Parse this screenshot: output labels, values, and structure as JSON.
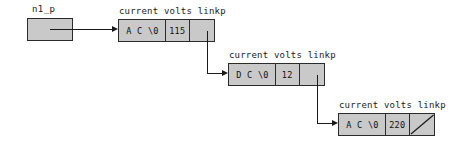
{
  "diagram": {
    "colors": {
      "box_fill": "#c9c9c9",
      "box_border": "#2b2b2b",
      "line": "#1a1a1a",
      "background": "#ffffff",
      "text": "#101010"
    },
    "pointer_variable": {
      "label": "n1_p",
      "name": "n1_p-pointer-box"
    },
    "field_headers": [
      "current",
      "volts",
      "linkp"
    ],
    "nodes": [
      {
        "id": "node-1",
        "header": "current volts linkp",
        "current": "A C \\0",
        "volts": "115",
        "linkp": "",
        "linkp_is_null": false
      },
      {
        "id": "node-2",
        "header": "current volts linkp",
        "current": "D C \\0",
        "volts": "12",
        "linkp": "",
        "linkp_is_null": false
      },
      {
        "id": "node-3",
        "header": "current volts linkp",
        "current": "A C \\0",
        "volts": "220",
        "linkp": "",
        "linkp_is_null": true
      }
    ]
  }
}
